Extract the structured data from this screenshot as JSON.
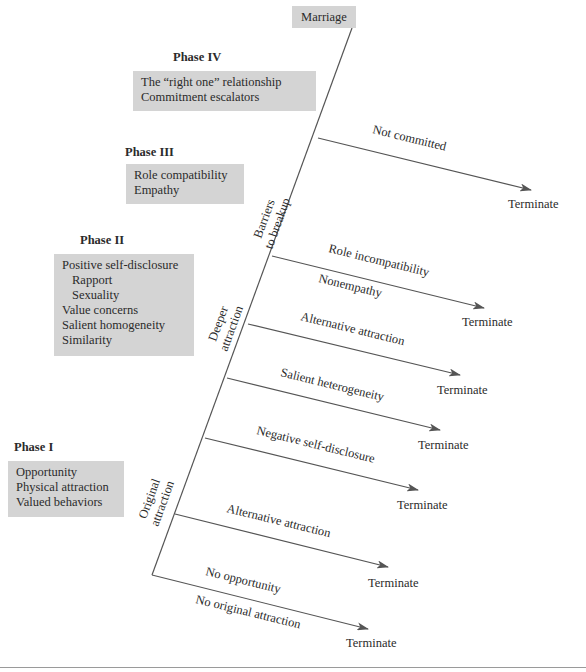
{
  "diagram": {
    "top_node": "Marriage",
    "phases": [
      {
        "id": "phase-4",
        "title": "Phase IV",
        "items": [
          {
            "text": "The “right one” relationship",
            "indent": false
          },
          {
            "text": "Commitment escalators",
            "indent": false
          }
        ]
      },
      {
        "id": "phase-3",
        "title": "Phase III",
        "items": [
          {
            "text": "Role compatibility",
            "indent": false
          },
          {
            "text": "Empathy",
            "indent": false
          }
        ]
      },
      {
        "id": "phase-2",
        "title": "Phase II",
        "items": [
          {
            "text": "Positive self-disclosure",
            "indent": false
          },
          {
            "text": "Rapport",
            "indent": true
          },
          {
            "text": "Sexuality",
            "indent": true
          },
          {
            "text": "Value concerns",
            "indent": false
          },
          {
            "text": "Salient homogeneity",
            "indent": false
          },
          {
            "text": "Similarity",
            "indent": false
          }
        ]
      },
      {
        "id": "phase-1",
        "title": "Phase I",
        "items": [
          {
            "text": "Opportunity",
            "indent": false
          },
          {
            "text": "Physical attraction",
            "indent": false
          },
          {
            "text": "Valued behaviors",
            "indent": false
          }
        ]
      }
    ],
    "trunk_labels": [
      {
        "line1": "Barriers",
        "line2": "to breakup"
      },
      {
        "line1": "Deeper",
        "line2": "attraction"
      },
      {
        "line1": "Original",
        "line2": "attraction"
      }
    ],
    "branches": [
      {
        "label_above": "Not committed",
        "label_below": "",
        "outcome": "Terminate"
      },
      {
        "label_above": "Role incompatibility",
        "label_below": "Nonempathy",
        "outcome": "Terminate"
      },
      {
        "label_above": "Alternative attraction",
        "label_below": "",
        "outcome": "Terminate"
      },
      {
        "label_above": "Salient heterogeneity",
        "label_below": "",
        "outcome": "Terminate"
      },
      {
        "label_above": "Negative self-disclosure",
        "label_below": "",
        "outcome": "Terminate"
      },
      {
        "label_above": "Alternative attraction",
        "label_below": "",
        "outcome": "Terminate"
      },
      {
        "label_above": "No opportunity",
        "label_below": "No original attraction",
        "outcome": "Terminate"
      }
    ],
    "colors": {
      "box_fill": "#d4d4d4",
      "line": "#555555",
      "text": "#2b2b2b"
    }
  }
}
